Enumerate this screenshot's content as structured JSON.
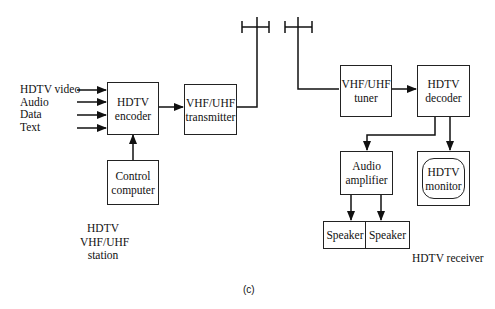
{
  "diagram": {
    "inputs": [
      "HDTV video",
      "Audio",
      "Data",
      "Text"
    ],
    "station": {
      "encoder": "HDTV\nencoder",
      "transmitter": "VHF/UHF\ntransmitter",
      "control_computer": "Control\ncomputer",
      "label": "HDTV\nVHF/UHF\nstation"
    },
    "receiver": {
      "tuner": "VHF/UHF\ntuner",
      "decoder": "HDTV\ndecoder",
      "amplifier": "Audio\namplifier",
      "monitor": "HDTV\nmonitor",
      "speaker_left": "Speaker",
      "speaker_right": "Speaker",
      "label": "HDTV receiver"
    },
    "caption": "(c)"
  }
}
